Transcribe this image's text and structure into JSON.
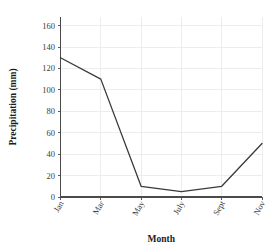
{
  "chart_data": {
    "type": "line",
    "title": "",
    "subtitle": "",
    "xlabel": "Month",
    "ylabel": "Precipitation (mm)",
    "categories": [
      "Jan",
      "Mar",
      "May",
      "July",
      "Sept",
      "Nov"
    ],
    "values": [
      130,
      110,
      10,
      5,
      10,
      50
    ],
    "series": [
      {
        "name": "Precipitation",
        "values": [
          130,
          110,
          10,
          5,
          10,
          50
        ],
        "color": "#3a3a3a"
      }
    ],
    "xlim": [
      0,
      5
    ],
    "ylim": [
      0,
      168
    ],
    "ytick_values": [
      0,
      20,
      40,
      60,
      80,
      100,
      120,
      140,
      160
    ],
    "ytick_labels": [
      "0",
      "20",
      "40",
      "60",
      "80",
      "100",
      "120",
      "140",
      "160"
    ],
    "xtick_labels": [
      "Jan",
      "Mar",
      "May",
      "July",
      "Sept",
      "Nov"
    ],
    "xtick_rotation": 60,
    "grid": true,
    "grid_color": "#e9e9e9",
    "legend": false,
    "legend_position": "none",
    "annotations": [],
    "line_color": "#3a3a3a",
    "axis_color": "#4a4a4a",
    "background_color": "#ffffff"
  },
  "axes": {
    "y_title": "Precipitation (mm)",
    "x_title": "Month"
  }
}
